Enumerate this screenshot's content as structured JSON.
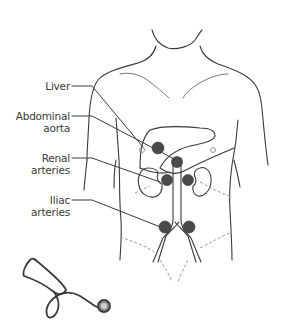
{
  "diagram": {
    "type": "anatomical-auscultation-sites",
    "labels": [
      {
        "id": "liver",
        "lines": [
          "Liver"
        ]
      },
      {
        "id": "abdominal-aorta",
        "lines": [
          "Abdominal",
          "aorta"
        ]
      },
      {
        "id": "renal-arteries",
        "lines": [
          "Renal",
          "arteries"
        ]
      },
      {
        "id": "iliac-arteries",
        "lines": [
          "Iliac",
          "arteries"
        ]
      }
    ],
    "colors": {
      "outline": "#3a3a3a",
      "site_marker": "#4a4a4a",
      "dashed": "#9a9a9a",
      "background": "#ffffff"
    },
    "illustration": "stethoscope"
  }
}
